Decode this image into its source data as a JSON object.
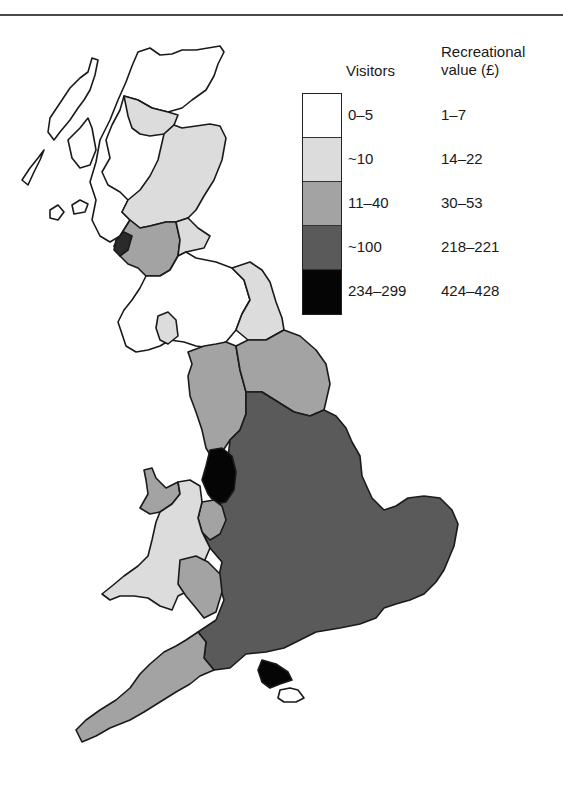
{
  "figure": {
    "type": "choropleth map",
    "region": "Great Britain"
  },
  "legend": {
    "visitors_header": "Visitors",
    "value_header_line1": "Recreational",
    "value_header_line2": "value (£)",
    "classes": [
      {
        "visitors": "0–5",
        "value": "1–7",
        "color": "#ffffff"
      },
      {
        "visitors": "~10",
        "value": "14–22",
        "color": "#dcdcdc"
      },
      {
        "visitors": "11–40",
        "value": "30–53",
        "color": "#a3a3a3"
      },
      {
        "visitors": "~100",
        "value": "218–221",
        "color": "#5a5a5a"
      },
      {
        "visitors": "234–299",
        "value": "424–428",
        "color": "#050505"
      }
    ]
  },
  "regions": [
    {
      "name": "Northern Highlands",
      "class": 0
    },
    {
      "name": "Moray / Inverness",
      "class": 1
    },
    {
      "name": "North-east Scotland",
      "class": 1
    },
    {
      "name": "Strathclyde / Glasgow",
      "class": 2
    },
    {
      "name": "Lothian / Borders east",
      "class": 1
    },
    {
      "name": "Dumfries & Galloway / Borders",
      "class": 0
    },
    {
      "name": "Galloway pocket",
      "class": 1
    },
    {
      "name": "Cumbria",
      "class": 2
    },
    {
      "name": "Northumberland / Durham",
      "class": 2
    },
    {
      "name": "Greater Manchester / Merseyside",
      "class": 4
    },
    {
      "name": "Cheshire",
      "class": 2
    },
    {
      "name": "Anglesey / North-west Wales",
      "class": 2
    },
    {
      "name": "Mid and South Wales",
      "class": 1
    },
    {
      "name": "Herefordshire / Gloucester",
      "class": 2
    },
    {
      "name": "England (Yorkshire, Midlands, South-east, East Anglia)",
      "class": 3
    },
    {
      "name": "South-west England",
      "class": 2
    },
    {
      "name": "Hampshire coast",
      "class": 4
    },
    {
      "name": "Isle of Wight",
      "class": 0
    }
  ],
  "colors": {
    "outline": "#1a1a1a",
    "rule": "#4a4a4a"
  }
}
